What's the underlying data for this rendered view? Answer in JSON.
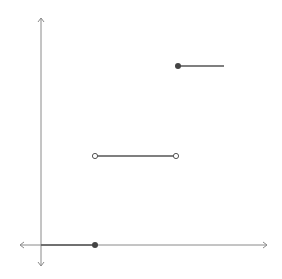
{
  "diagram": {
    "type": "step-function-graph",
    "colors": {
      "axis": "#8a8a8a",
      "segment": "#555555",
      "closed_dot": "#444444",
      "open_dot_stroke": "#555555",
      "background": "#ffffff"
    },
    "axes": {
      "origin": [
        41,
        245
      ],
      "x_axis": {
        "from": 20,
        "to": 267
      },
      "y_axis": {
        "from": 18,
        "to": 266
      }
    },
    "segments": [
      {
        "name": "lower-step",
        "x1": 41,
        "y": 245,
        "x2": 95,
        "left_end": "none",
        "right_end": "closed"
      },
      {
        "name": "middle-step",
        "x1": 95,
        "y": 156,
        "x2": 176,
        "left_end": "open",
        "right_end": "open"
      },
      {
        "name": "upper-step",
        "x1": 178,
        "y": 66,
        "x2": 224,
        "left_end": "closed",
        "right_end": "none"
      }
    ]
  }
}
